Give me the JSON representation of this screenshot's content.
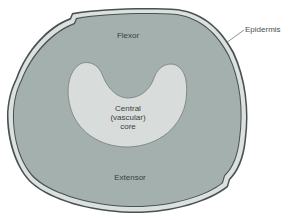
{
  "diagram": {
    "type": "cross-section",
    "labels": {
      "flexor": "Flexor",
      "central_core": [
        "Central",
        "(vascular)",
        "core"
      ],
      "extensor": "Extensor",
      "epidermis": "Epidermis"
    },
    "colors": {
      "background": "#ffffff",
      "tissue_fill": "#a3b0ae",
      "epidermis_band": "#d9dfde",
      "outline": "#4a5150",
      "core_fill": "#d8dcdb",
      "text": "#3a3f40"
    }
  }
}
